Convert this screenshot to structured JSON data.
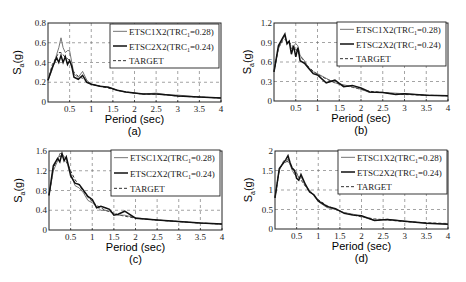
{
  "figure": {
    "xlabel": "Period (sec)",
    "ylabel_main": "S",
    "ylabel_sub": "a",
    "ylabel_unit": "(g)",
    "legend": [
      {
        "label": "ETSC1X2(TRC",
        "sub": "1",
        "suffix": "=0.28)",
        "style": "solid-thin",
        "color": "#555555"
      },
      {
        "label": "ETSC2X2(TRC",
        "sub": "1",
        "suffix": "=0.24)",
        "style": "solid-thick",
        "color": "#111111"
      },
      {
        "label": "TARGET",
        "sub": "",
        "suffix": "",
        "style": "dashed",
        "color": "#333333"
      }
    ]
  },
  "chart_data": [
    {
      "id": "a",
      "caption": "(a)",
      "type": "line",
      "xlabel": "Period (sec)",
      "ylabel": "Sa (g)",
      "xlim": [
        0,
        4
      ],
      "ylim": [
        0,
        0.8
      ],
      "xticks": [
        0.5,
        1,
        1.5,
        2,
        2.5,
        3,
        3.5,
        4
      ],
      "xtick_labels": [
        "0.5",
        "1",
        "1.5",
        "2",
        "2.5",
        "3",
        "3.5",
        "4"
      ],
      "yticks": [
        0,
        0.2,
        0.4,
        0.6,
        0.8
      ],
      "ytick_labels": [
        "0",
        "0.2",
        "0.4",
        "0.6",
        "0.8"
      ],
      "grid": true,
      "legend_position": "upper right",
      "x": [
        0.0,
        0.1,
        0.2,
        0.25,
        0.3,
        0.35,
        0.4,
        0.45,
        0.5,
        0.55,
        0.6,
        0.7,
        0.8,
        0.9,
        1.0,
        1.2,
        1.4,
        1.6,
        1.8,
        2.0,
        2.2,
        2.5,
        2.8,
        3.0,
        3.5,
        4.0
      ],
      "series": [
        {
          "name": "ETSC1X2(TRC1=0.28)",
          "values": [
            0.22,
            0.33,
            0.48,
            0.55,
            0.65,
            0.55,
            0.5,
            0.52,
            0.52,
            0.4,
            0.28,
            0.25,
            0.31,
            0.22,
            0.18,
            0.16,
            0.15,
            0.12,
            0.1,
            0.09,
            0.08,
            0.09,
            0.07,
            0.07,
            0.05,
            0.04
          ]
        },
        {
          "name": "ETSC2X2(TRC1=0.24)",
          "values": [
            0.22,
            0.35,
            0.45,
            0.4,
            0.47,
            0.4,
            0.46,
            0.38,
            0.42,
            0.36,
            0.25,
            0.23,
            0.27,
            0.2,
            0.18,
            0.16,
            0.15,
            0.12,
            0.1,
            0.09,
            0.08,
            0.08,
            0.07,
            0.06,
            0.05,
            0.04
          ]
        },
        {
          "name": "TARGET",
          "values": [
            0.22,
            0.38,
            0.46,
            0.5,
            0.5,
            0.48,
            0.45,
            0.44,
            0.42,
            0.36,
            0.3,
            0.26,
            0.24,
            0.2,
            0.18,
            0.16,
            0.14,
            0.12,
            0.1,
            0.09,
            0.08,
            0.08,
            0.07,
            0.06,
            0.05,
            0.04
          ]
        }
      ]
    },
    {
      "id": "b",
      "caption": "(b)",
      "type": "line",
      "xlabel": "Period (sec)",
      "ylabel": "Sa (g)",
      "xlim": [
        0,
        4
      ],
      "ylim": [
        0,
        1.2
      ],
      "xticks": [
        0.5,
        1,
        1.5,
        2,
        2.5,
        3,
        3.5,
        4
      ],
      "xtick_labels": [
        "0.5",
        "1",
        "1.5",
        "2",
        "2.5",
        "3",
        "3.5",
        "4"
      ],
      "yticks": [
        0,
        0.3,
        0.6,
        0.9,
        1.2
      ],
      "ytick_labels": [
        "0",
        "0.3",
        "0.6",
        "0.9",
        "1.2"
      ],
      "grid": true,
      "legend_position": "upper right",
      "x": [
        0.0,
        0.1,
        0.2,
        0.25,
        0.3,
        0.35,
        0.4,
        0.45,
        0.5,
        0.55,
        0.6,
        0.7,
        0.8,
        0.9,
        1.0,
        1.2,
        1.4,
        1.6,
        1.8,
        2.0,
        2.2,
        2.5,
        2.8,
        3.0,
        3.5,
        4.0
      ],
      "series": [
        {
          "name": "ETSC1X2(TRC1=0.28)",
          "values": [
            0.45,
            0.8,
            0.95,
            1.0,
            0.9,
            0.92,
            0.8,
            0.85,
            0.88,
            0.85,
            0.7,
            0.62,
            0.5,
            0.45,
            0.42,
            0.35,
            0.28,
            0.25,
            0.22,
            0.18,
            0.13,
            0.13,
            0.12,
            0.11,
            0.09,
            0.08
          ]
        },
        {
          "name": "ETSC2X2(TRC1=0.24)",
          "values": [
            0.45,
            0.85,
            0.97,
            1.03,
            0.88,
            0.92,
            0.72,
            0.85,
            0.68,
            0.82,
            0.62,
            0.58,
            0.5,
            0.42,
            0.4,
            0.28,
            0.32,
            0.22,
            0.24,
            0.2,
            0.14,
            0.13,
            0.1,
            0.11,
            0.09,
            0.08
          ]
        },
        {
          "name": "TARGET",
          "values": [
            0.45,
            0.82,
            0.93,
            0.95,
            0.92,
            0.9,
            0.87,
            0.83,
            0.8,
            0.75,
            0.7,
            0.6,
            0.52,
            0.46,
            0.41,
            0.34,
            0.28,
            0.24,
            0.21,
            0.18,
            0.15,
            0.13,
            0.11,
            0.1,
            0.09,
            0.08
          ]
        }
      ]
    },
    {
      "id": "c",
      "caption": "(c)",
      "type": "line",
      "xlabel": "Period (sec)",
      "ylabel": "Sa (g)",
      "xlim": [
        0,
        4
      ],
      "ylim": [
        0,
        1.6
      ],
      "xticks": [
        0.5,
        1,
        1.5,
        2,
        2.5,
        3,
        3.5,
        4
      ],
      "xtick_labels": [
        "0.5",
        "1",
        "1.5",
        "2",
        "2.5",
        "3",
        "3.5",
        "4"
      ],
      "yticks": [
        0,
        0.4,
        0.8,
        1.2,
        1.6
      ],
      "ytick_labels": [
        "0",
        "0.4",
        "0.8",
        "1.2",
        "1.6"
      ],
      "grid": true,
      "legend_position": "upper right",
      "x": [
        0.0,
        0.1,
        0.2,
        0.25,
        0.3,
        0.35,
        0.4,
        0.45,
        0.5,
        0.6,
        0.7,
        0.8,
        0.9,
        1.0,
        1.1,
        1.2,
        1.3,
        1.4,
        1.5,
        1.6,
        1.75,
        2.0,
        2.5,
        3.0,
        3.5,
        4.0
      ],
      "series": [
        {
          "name": "ETSC1X2(TRC1=0.28)",
          "values": [
            0.7,
            1.2,
            1.4,
            1.55,
            1.55,
            1.48,
            1.45,
            1.25,
            1.15,
            0.9,
            0.85,
            0.75,
            0.6,
            0.55,
            0.48,
            0.4,
            0.4,
            0.38,
            0.33,
            0.3,
            0.3,
            0.25,
            0.2,
            0.17,
            0.14,
            0.12
          ]
        },
        {
          "name": "ETSC2X2(TRC1=0.24)",
          "values": [
            0.7,
            1.3,
            1.45,
            1.38,
            1.55,
            1.4,
            1.48,
            1.3,
            1.1,
            0.95,
            0.92,
            0.8,
            0.68,
            0.62,
            0.45,
            0.48,
            0.45,
            0.42,
            0.3,
            0.32,
            0.38,
            0.24,
            0.2,
            0.17,
            0.14,
            0.12
          ]
        },
        {
          "name": "TARGET",
          "values": [
            0.7,
            1.25,
            1.45,
            1.5,
            1.48,
            1.44,
            1.38,
            1.3,
            1.2,
            1.02,
            0.9,
            0.78,
            0.66,
            0.58,
            0.5,
            0.45,
            0.4,
            0.37,
            0.34,
            0.31,
            0.28,
            0.24,
            0.2,
            0.17,
            0.14,
            0.12
          ]
        }
      ]
    },
    {
      "id": "d",
      "caption": "(d)",
      "type": "line",
      "xlabel": "Period (sec)",
      "ylabel": "Sa (g)",
      "xlim": [
        0,
        4
      ],
      "ylim": [
        0,
        2
      ],
      "xticks": [
        0.5,
        1,
        1.5,
        2,
        2.5,
        3,
        3.5,
        4
      ],
      "xtick_labels": [
        "0.5",
        "1",
        "1.5",
        "2",
        "2.5",
        "3",
        "3.5",
        "4"
      ],
      "yticks": [
        0,
        0.5,
        1,
        1.5,
        2
      ],
      "ytick_labels": [
        "0",
        "0.5",
        "1",
        "1.5",
        "2"
      ],
      "grid": true,
      "legend_position": "upper right",
      "x": [
        0.0,
        0.1,
        0.2,
        0.25,
        0.3,
        0.35,
        0.4,
        0.45,
        0.5,
        0.55,
        0.6,
        0.7,
        0.8,
        0.9,
        1.0,
        1.2,
        1.4,
        1.6,
        1.8,
        2.0,
        2.3,
        2.6,
        3.0,
        3.5,
        4.0
      ],
      "series": [
        {
          "name": "ETSC1X2(TRC1=0.28)",
          "values": [
            0.8,
            1.5,
            1.75,
            1.7,
            1.8,
            1.65,
            1.5,
            1.4,
            1.45,
            1.3,
            1.35,
            1.1,
            1.0,
            0.85,
            0.7,
            0.55,
            0.5,
            0.42,
            0.38,
            0.32,
            0.22,
            0.25,
            0.2,
            0.15,
            0.13
          ]
        },
        {
          "name": "ETSC2X2(TRC1=0.24)",
          "values": [
            0.8,
            1.55,
            1.7,
            1.78,
            1.88,
            1.7,
            1.55,
            1.5,
            1.3,
            1.25,
            1.4,
            1.15,
            0.95,
            0.88,
            0.72,
            0.58,
            0.52,
            0.4,
            0.36,
            0.34,
            0.22,
            0.24,
            0.2,
            0.15,
            0.12
          ]
        },
        {
          "name": "TARGET",
          "values": [
            0.8,
            1.52,
            1.72,
            1.75,
            1.72,
            1.66,
            1.58,
            1.5,
            1.42,
            1.34,
            1.26,
            1.1,
            0.96,
            0.85,
            0.75,
            0.6,
            0.5,
            0.42,
            0.36,
            0.31,
            0.26,
            0.23,
            0.19,
            0.16,
            0.14
          ]
        }
      ]
    }
  ]
}
